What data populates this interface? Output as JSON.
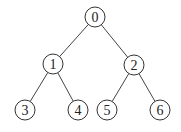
{
  "diagram": {
    "type": "binary-tree",
    "nodes": [
      {
        "id": "0",
        "label": "0",
        "x": 95,
        "y": 17
      },
      {
        "id": "1",
        "label": "1",
        "x": 53,
        "y": 64
      },
      {
        "id": "2",
        "label": "2",
        "x": 134,
        "y": 65
      },
      {
        "id": "3",
        "label": "3",
        "x": 25,
        "y": 110
      },
      {
        "id": "4",
        "label": "4",
        "x": 78,
        "y": 110
      },
      {
        "id": "5",
        "label": "5",
        "x": 107,
        "y": 110
      },
      {
        "id": "6",
        "label": "6",
        "x": 160,
        "y": 110
      }
    ],
    "edges": [
      {
        "from": "0",
        "to": "1"
      },
      {
        "from": "0",
        "to": "2"
      },
      {
        "from": "1",
        "to": "3"
      },
      {
        "from": "1",
        "to": "4"
      },
      {
        "from": "2",
        "to": "5"
      },
      {
        "from": "2",
        "to": "6"
      }
    ],
    "radius": 10
  }
}
